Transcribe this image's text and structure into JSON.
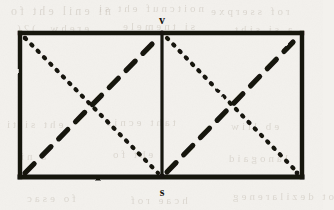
{
  "figure": {
    "type": "geometric-diagram",
    "background_color": "#f3f1ed",
    "ink_color": "#16130f",
    "labels": {
      "top_vertex": "v",
      "bottom_vertex": "s"
    },
    "geometry": {
      "outer_rectangle": {
        "x": 20,
        "y": 33,
        "width": 282,
        "height": 144
      },
      "vertical_divider_x": 162,
      "left_cell": {
        "x": 20,
        "y": 33,
        "width": 142,
        "height": 144
      },
      "right_cell": {
        "x": 162,
        "y": 33,
        "width": 140,
        "height": 144
      },
      "border_stroke_width": 4,
      "divider_stroke_width": 3
    },
    "diagonals": [
      {
        "cell": "left",
        "style": "dotted",
        "from": "top-left",
        "to": "bottom-right"
      },
      {
        "cell": "left",
        "style": "dashed",
        "from": "bottom-left",
        "to": "top-right"
      },
      {
        "cell": "right",
        "style": "dotted",
        "from": "top-left",
        "to": "bottom-right"
      },
      {
        "cell": "right",
        "style": "dashed",
        "from": "bottom-left",
        "to": "top-right"
      }
    ],
    "vertex_markers": [
      {
        "name": "top-center",
        "x": 162,
        "y": 33
      },
      {
        "name": "bottom-center",
        "x": 162,
        "y": 177
      },
      {
        "name": "bottom-right",
        "x": 298,
        "y": 174
      },
      {
        "name": "top-left",
        "x": 25,
        "y": 38
      }
    ],
    "stroke_styles": {
      "dotted_dasharray": "1.5 7.5",
      "dotted_width": 4.2,
      "dashed_dasharray": "13 11",
      "dashed_width": 5.2
    }
  },
  "scan_artifacts": {
    "bleed_through_lines": [
      {
        "text": "ni enil eht fo",
        "left": 8,
        "top": 4,
        "size": 12,
        "spacing": 3
      },
      {
        "text": "noitcnuf eht si",
        "left": 96,
        "top": 2,
        "size": 11,
        "spacing": 3
      },
      {
        "text": "rof sserpxe",
        "left": 208,
        "top": 5,
        "size": 11,
        "spacing": 3
      },
      {
        "text": "erehw ,)2(",
        "left": 14,
        "top": 22,
        "size": 11,
        "spacing": 3
      },
      {
        "text": "si tnemele",
        "left": 120,
        "top": 20,
        "size": 11,
        "spacing": 3
      },
      {
        "text": "a si siht",
        "left": 232,
        "top": 23,
        "size": 11,
        "spacing": 3
      },
      {
        "text": "eht si ti",
        "left": 4,
        "top": 118,
        "size": 11,
        "spacing": 3
      },
      {
        "text": "taht ecnis",
        "left": 104,
        "top": 116,
        "size": 11,
        "spacing": 3
      },
      {
        "text": "eb lliw",
        "left": 228,
        "top": 120,
        "size": 11,
        "spacing": 3
      },
      {
        "text": "a ni",
        "left": 18,
        "top": 150,
        "size": 11,
        "spacing": 3
      },
      {
        "text": "eht fo",
        "left": 110,
        "top": 148,
        "size": 11,
        "spacing": 3
      },
      {
        "text": "lanogaid",
        "left": 226,
        "top": 152,
        "size": 11,
        "spacing": 3
      },
      {
        "text": "fo esac",
        "left": 24,
        "top": 192,
        "size": 11,
        "spacing": 3
      },
      {
        "text": "hcae rof",
        "left": 128,
        "top": 194,
        "size": 11,
        "spacing": 3
      },
      {
        "text": "ot dezilareneg",
        "left": 230,
        "top": 190,
        "size": 11,
        "spacing": 3
      }
    ]
  }
}
